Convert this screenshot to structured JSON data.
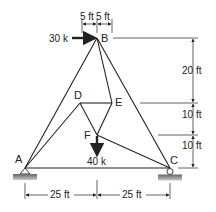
{
  "diagram": {
    "type": "truss",
    "nodes": {
      "A": {
        "label": "A",
        "x": 25,
        "y": 168,
        "support": "pin"
      },
      "B": {
        "label": "B",
        "x": 97,
        "y": 38
      },
      "C": {
        "label": "C",
        "x": 170,
        "y": 168,
        "support": "roller"
      },
      "D": {
        "label": "D",
        "x": 80,
        "y": 103
      },
      "E": {
        "label": "E",
        "x": 112,
        "y": 103
      },
      "F": {
        "label": "F",
        "x": 97,
        "y": 135
      }
    },
    "members": [
      [
        "A",
        "B"
      ],
      [
        "B",
        "C"
      ],
      [
        "A",
        "C"
      ],
      [
        "B",
        "E"
      ],
      [
        "D",
        "E"
      ],
      [
        "D",
        "F"
      ],
      [
        "E",
        "F"
      ],
      [
        "A",
        "D"
      ],
      [
        "F",
        "C"
      ]
    ],
    "loads": [
      {
        "node": "B",
        "label": "30 k",
        "direction": "right"
      },
      {
        "node": "F",
        "label": "40 k",
        "direction": "down"
      }
    ],
    "dimensions": {
      "top": [
        "5 ft",
        "5 ft"
      ],
      "right": [
        "20 ft",
        "10 ft",
        "10 ft"
      ],
      "bottom": [
        "25 ft",
        "25 ft"
      ]
    },
    "colors": {
      "line": "#222222",
      "support": "#8a8a8a"
    }
  }
}
